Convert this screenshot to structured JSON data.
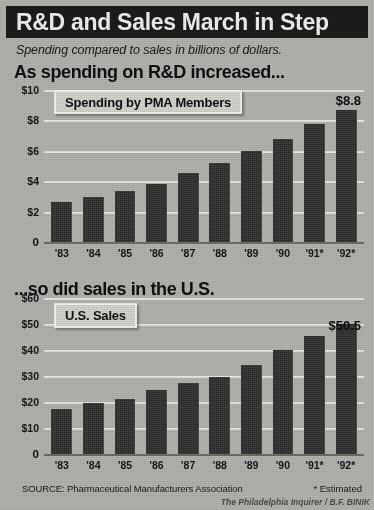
{
  "masthead": {
    "title": "R&D and Sales March in Step"
  },
  "subtitle": "Spending compared to sales in billions of dollars.",
  "headlines": {
    "top": "As spending on R&D increased...",
    "bottom": "...so did sales in the U.S."
  },
  "legends": {
    "spending": "Spending by PMA Members",
    "sales": "U.S. Sales"
  },
  "callouts": {
    "spending_last": "$8.8",
    "sales_last": "$50.5"
  },
  "footer": {
    "source": "SOURCE: Pharmaceutical Manufacturers Association",
    "estimated_note": "* Estimated",
    "credit": "The Philadelphia Inquirer / B.F. BINIK"
  },
  "colors": {
    "background": "#b5b5b0",
    "masthead_bg": "#1c1c1c",
    "masthead_fg": "#f2f2ee",
    "bar": "#2e2e2e",
    "gridline": "#e9e9e4",
    "axis": "#6e6e69",
    "legend_bg": "#d6d6d1",
    "legend_border": "#f4f4f0"
  },
  "chart_data": [
    {
      "type": "bar",
      "id": "spending-by-pma-members",
      "title": "Spending by PMA Members",
      "section_headline": "As spending on R&D increased...",
      "xlabel": "",
      "ylabel": "",
      "ylim": [
        0,
        10
      ],
      "yticks": [
        0,
        2,
        4,
        6,
        8,
        10
      ],
      "ytick_labels": [
        "0",
        "$2",
        "$4",
        "$6",
        "$8",
        "$10"
      ],
      "grid": true,
      "legend_position": "top-left-callout",
      "units": "billions of dollars",
      "categories": [
        "'83",
        "'84",
        "'85",
        "'86",
        "'87",
        "'88",
        "'89",
        "'90",
        "'91*",
        "'92*"
      ],
      "values": [
        2.7,
        3.0,
        3.4,
        3.9,
        4.6,
        5.3,
        6.1,
        6.9,
        7.9,
        8.8
      ],
      "annotations": [
        {
          "category": "'92*",
          "text": "$8.8"
        }
      ]
    },
    {
      "type": "bar",
      "id": "us-sales",
      "title": "U.S. Sales",
      "section_headline": "...so did sales in the U.S.",
      "xlabel": "",
      "ylabel": "",
      "ylim": [
        0,
        60
      ],
      "yticks": [
        0,
        10,
        20,
        30,
        40,
        50,
        60
      ],
      "ytick_labels": [
        "0",
        "$10",
        "$20",
        "$30",
        "$40",
        "$50",
        "$60"
      ],
      "grid": true,
      "legend_position": "top-left-callout",
      "units": "billions of dollars",
      "categories": [
        "'83",
        "'84",
        "'85",
        "'86",
        "'87",
        "'88",
        "'89",
        "'90",
        "'91*",
        "'92*"
      ],
      "values": [
        17.5,
        20.0,
        21.5,
        25.0,
        27.5,
        30.0,
        34.5,
        40.5,
        46.0,
        50.5
      ],
      "annotations": [
        {
          "category": "'92*",
          "text": "$50.5"
        }
      ]
    }
  ]
}
